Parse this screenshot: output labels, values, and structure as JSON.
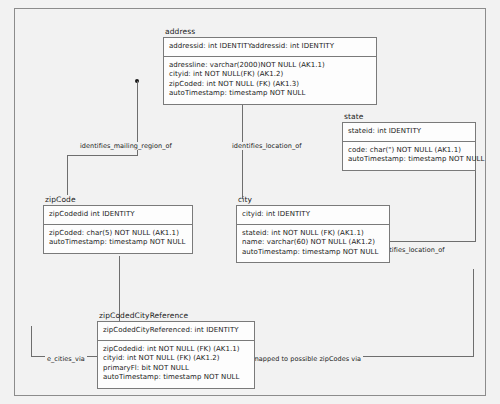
{
  "diagram": {
    "kind": "entity-relationship-diagram",
    "background_color": "#f2f2f2",
    "line_color": "#6e6e6e",
    "entity_fill": "#fdfdfd",
    "entity_border": "#7a7a7a",
    "entities": [
      {
        "name": "address",
        "primary_key": "addressid: int IDENTITYaddressid: int IDENTITY",
        "attributes": [
          "adressline: varchar(2000)NOT NULL (AK1.1)",
          "cityid: int NOT NULL(FK) (AK1.2)",
          "zipCoded: int NOT NULL (FK) (AK1.3)",
          "autoTimestamp: timestamp NOT NULL"
        ]
      },
      {
        "name": "state",
        "primary_key": "stateid: int IDENTITY",
        "attributes": [
          "code: char(\") NOT NULL (AK1.1)",
          "autoTimestamp: timestamp NOT NULL"
        ]
      },
      {
        "name": "zipCode",
        "primary_key": "zipCodedid int IDENTITY",
        "attributes": [
          "zipCoded: char(5) NOT NULL (AK1.1)",
          "autoTimestamp: timestamp NOT NULL"
        ]
      },
      {
        "name": "city",
        "primary_key": "cityid: int IDENTITY",
        "attributes": [
          "stateid: int NOT NULL (FK) (AK1.1)",
          "name: varchar(60) NOT NULL (AK1.2)",
          "autoTimestamp: timestamp NOT NULL"
        ]
      },
      {
        "name": "zipCodedCityReference",
        "primary_key": "zipCodedCityReferenced: int IDENTITY",
        "attributes": [
          "zipCodedid: int NOT NULL (FK) (AK1.1)",
          "cityid: int NOT NULL (FK) (AK1.2)",
          "primaryFl: bit NOT NULL",
          "autoTimestamp: timestamp NOT NULL"
        ]
      }
    ],
    "relationships": [
      {
        "label": "identifies_mailing_region_of"
      },
      {
        "label": "identifies_location_of"
      },
      {
        "label": "identifies_location_of"
      },
      {
        "label": "e_cities_via"
      },
      {
        "label": "is mapped to possible zipCodes via"
      }
    ]
  }
}
